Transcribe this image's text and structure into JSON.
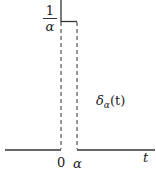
{
  "diagram": {
    "function_label": {
      "symbol": "δ",
      "subscript": "α",
      "argument": "(t)"
    },
    "y_label": {
      "numerator": "1",
      "denominator": "α"
    },
    "x_ticks": [
      "0",
      "α"
    ],
    "x_axis_label": "t",
    "colors": {
      "line": "#333333",
      "text": "#222222",
      "background": "#ffffff"
    }
  }
}
